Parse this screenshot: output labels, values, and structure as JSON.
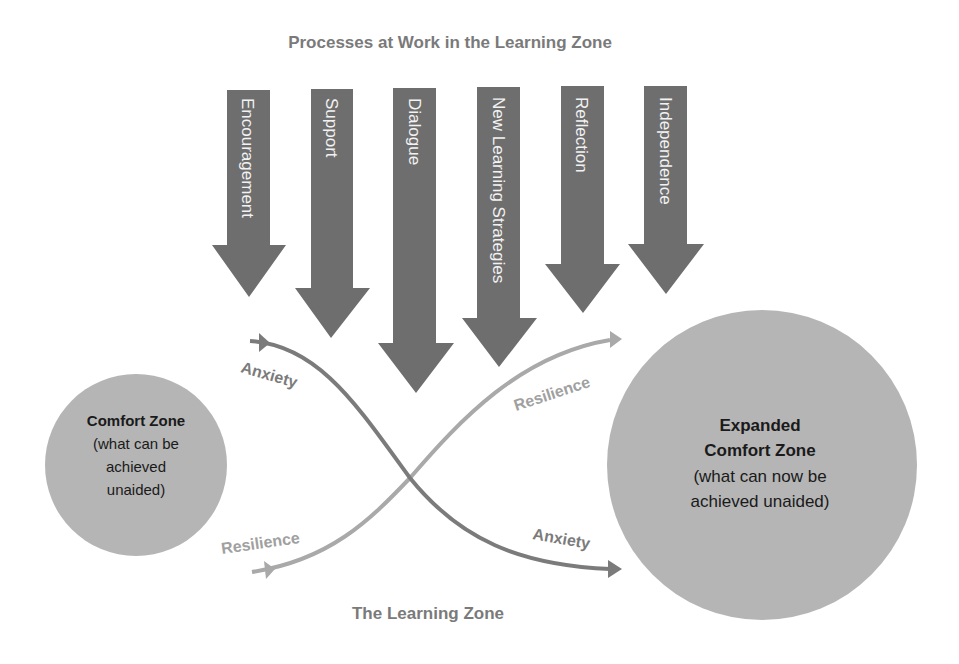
{
  "title": "Processes at Work in the Learning Zone",
  "footer_label": "The Learning Zone",
  "colors": {
    "arrow": "#6e6e6e",
    "arrow_text": "#f2f2f2",
    "circle": "#b5b5b5",
    "anxiety": "#7b7b7b",
    "resilience": "#a9a9a9",
    "title": "#7a7a7a"
  },
  "processes": [
    {
      "label": "Encouragement"
    },
    {
      "label": "Support"
    },
    {
      "label": "Dialogue"
    },
    {
      "label": "New Learning Strategies"
    },
    {
      "label": "Reflection"
    },
    {
      "label": "Independence"
    }
  ],
  "comfort_zone": {
    "title": "Comfort Zone",
    "lines": [
      "(what can be",
      "achieved",
      "unaided)"
    ]
  },
  "expanded_zone": {
    "title_lines": [
      "Expanded",
      "Comfort Zone"
    ],
    "lines": [
      "(what can now be",
      "achieved unaided)"
    ]
  },
  "curves": {
    "anxiety_start": "Anxiety",
    "anxiety_end": "Anxiety",
    "resilience_start": "Resilience",
    "resilience_end": "Resilience"
  }
}
